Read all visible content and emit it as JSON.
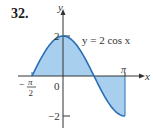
{
  "problem_number": "32.",
  "equation_label": "y = 2 cos x",
  "axis_labels": {
    "x": "x",
    "y": "y"
  },
  "tick_labels": {
    "neg_pi_over_2_minus": "−",
    "pi_num": "π",
    "denom": "2",
    "zero": "0",
    "pi": "π",
    "y_top": "2",
    "y_bottom": "−2"
  },
  "colors": {
    "curve": "#2a6fb5",
    "fill": "#a9cfee",
    "axis": "#333333"
  },
  "chart_data": {
    "type": "area",
    "title": "y = 2 cos x",
    "xlabel": "x",
    "ylabel": "y",
    "function": "2*cos(x)",
    "x_range": [
      "-π/2",
      "π"
    ],
    "xlim": [
      -1.5708,
      3.1416
    ],
    "ylim": [
      -2,
      2
    ],
    "x_ticks": [
      "-π/2",
      "0",
      "π"
    ],
    "y_ticks": [
      "2",
      "-2"
    ],
    "shaded_region": "between curve and x-axis from x=-π/2 to x=π",
    "points": [
      {
        "x": -1.5708,
        "y": 0
      },
      {
        "x": -0.7854,
        "y": 1.414
      },
      {
        "x": 0,
        "y": 2
      },
      {
        "x": 0.7854,
        "y": 1.414
      },
      {
        "x": 1.5708,
        "y": 0
      },
      {
        "x": 2.3562,
        "y": -1.414
      },
      {
        "x": 3.1416,
        "y": -2
      }
    ],
    "grid": false,
    "legend": "none"
  }
}
